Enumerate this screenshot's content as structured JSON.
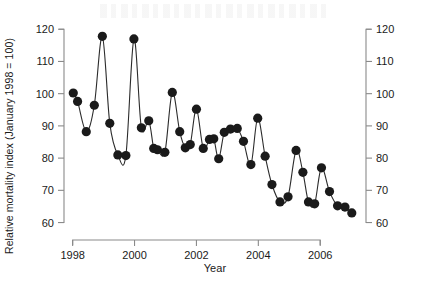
{
  "chart_data": {
    "type": "line",
    "title": "",
    "subtitle": "",
    "xlabel": "Year",
    "ylabel": "Relative mortality index (January 1998 = 100)",
    "ylabel_right": "Relative mortality index (January 1998 = 100)",
    "xlim": [
      1997.85,
      2007.35
    ],
    "ylim": [
      58,
      121
    ],
    "yticks": [
      60,
      70,
      80,
      90,
      100,
      110,
      120
    ],
    "ytick_labels": [
      "60",
      "70",
      "80",
      "90",
      "100",
      "110",
      "120"
    ],
    "yticks_right": [
      60,
      70,
      80,
      90,
      100,
      110,
      120
    ],
    "ytick_labels_right": [
      "60",
      "70",
      "80",
      "90",
      "100",
      "110",
      "120"
    ],
    "xticks": [
      1998,
      2000,
      2002,
      2004,
      2006
    ],
    "xtick_labels": [
      "1998",
      "2000",
      "2002",
      "2004",
      "2006"
    ],
    "grid": false,
    "legend": null,
    "marker": "filled-circle",
    "marker_color": "#1a1a1a",
    "line_color": "#2b2b2b",
    "line_width": 1.1,
    "marker_size": 4.6,
    "axis_color": "#8a8a8a",
    "series": [
      {
        "name": "Relative mortality index",
        "x": [
          1998.02,
          1998.16,
          1998.44,
          1998.7,
          1998.96,
          1999.2,
          1999.46,
          1999.72,
          1999.98,
          2000.22,
          2000.46,
          2000.62,
          2000.74,
          2000.98,
          2001.22,
          2001.46,
          2001.64,
          2001.8,
          2002.0,
          2002.22,
          2002.42,
          2002.56,
          2002.72,
          2002.9,
          2003.1,
          2003.32,
          2003.52,
          2003.76,
          2003.98,
          2004.22,
          2004.44,
          2004.7,
          2004.96,
          2005.22,
          2005.44,
          2005.62,
          2005.82,
          2006.04,
          2006.3,
          2006.56,
          2006.8,
          2007.02
        ],
        "y": [
          100.2,
          97.6,
          88.2,
          96.4,
          117.8,
          90.8,
          81.0,
          80.8,
          117.0,
          89.4,
          91.6,
          83.0,
          82.6,
          81.8,
          100.4,
          88.2,
          83.2,
          84.2,
          95.2,
          83.0,
          85.8,
          86.0,
          79.8,
          88.0,
          89.0,
          89.2,
          85.2,
          78.0,
          92.4,
          80.6,
          71.8,
          66.4,
          68.0,
          82.4,
          75.6,
          66.4,
          65.8,
          77.0,
          69.6,
          65.2,
          64.8,
          63.0
        ]
      }
    ]
  }
}
